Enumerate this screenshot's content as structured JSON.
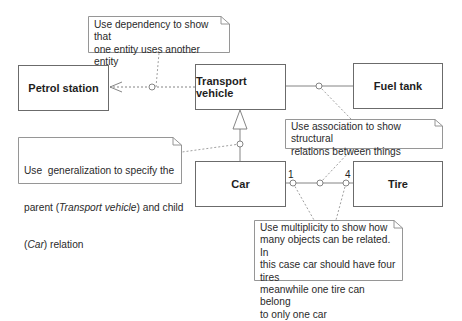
{
  "diagram": {
    "type": "UML class diagram with annotation notes",
    "classes": [
      {
        "id": "petrol_station",
        "label": "Petrol station"
      },
      {
        "id": "transport_vehicle",
        "label": "Transport vehicle"
      },
      {
        "id": "fuel_tank",
        "label": "Fuel tank"
      },
      {
        "id": "car",
        "label": "Car"
      },
      {
        "id": "tire",
        "label": "Tire"
      }
    ],
    "relations": [
      {
        "type": "dependency",
        "from": "Transport vehicle",
        "to": "Petrol station"
      },
      {
        "type": "association",
        "from": "Transport vehicle",
        "to": "Fuel tank"
      },
      {
        "type": "generalization",
        "child": "Car",
        "parent": "Transport vehicle"
      },
      {
        "type": "association",
        "from": "Car",
        "to": "Tire",
        "multiplicity_from": "1",
        "multiplicity_to": "4"
      }
    ],
    "multiplicity": {
      "car_end": "1",
      "tire_end": "4"
    },
    "notes": {
      "dependency": {
        "line1": "Use dependency to show that",
        "line2": "one entity uses another entity"
      },
      "association": {
        "line1": "Use association to show structural",
        "line2": "relations between things"
      },
      "generalization": {
        "line1": "Use  generalization to specify the",
        "line2_pre": "parent (",
        "line2_em": "Transport vehicle",
        "line2_post": ") and child",
        "line3_pre": "(",
        "line3_em": "Car",
        "line3_post": ") relation"
      },
      "multiplicity": {
        "line1": "Use multiplicity to show how",
        "line2": "many objects can be related. In",
        "line3": "this case car should have four tires",
        "line4": "meanwhile one tire can belong",
        "line5": "to only one car"
      }
    },
    "colors": {
      "line": "#6b6b6b",
      "note_border": "#8a8a8a",
      "text": "#222222",
      "background": "#ffffff"
    }
  }
}
